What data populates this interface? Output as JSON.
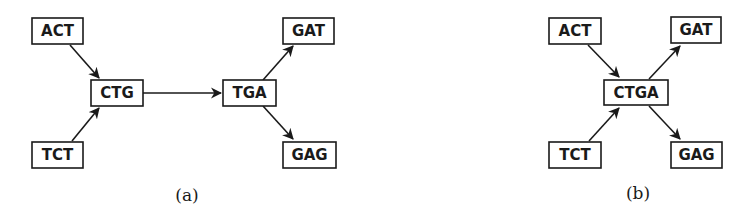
{
  "figure_a": {
    "caption": "(a)",
    "nodes": {
      "act": "ACT",
      "tct": "TCT",
      "ctg": "CTG",
      "tga": "TGA",
      "gat": "GAT",
      "gag": "GAG"
    },
    "edges": [
      {
        "from": "ACT",
        "to": "CTG"
      },
      {
        "from": "TCT",
        "to": "CTG"
      },
      {
        "from": "CTG",
        "to": "TGA"
      },
      {
        "from": "TGA",
        "to": "GAT"
      },
      {
        "from": "TGA",
        "to": "GAG"
      }
    ]
  },
  "figure_b": {
    "caption": "(b)",
    "nodes": {
      "act": "ACT",
      "tct": "TCT",
      "ctga": "CTGA",
      "gat": "GAT",
      "gag": "GAG"
    },
    "edges": [
      {
        "from": "ACT",
        "to": "CTGA"
      },
      {
        "from": "TCT",
        "to": "CTGA"
      },
      {
        "from": "CTGA",
        "to": "GAT"
      },
      {
        "from": "CTGA",
        "to": "GAG"
      }
    ]
  },
  "colors": {
    "stroke": "#1a1a1a",
    "background": "#ffffff"
  }
}
